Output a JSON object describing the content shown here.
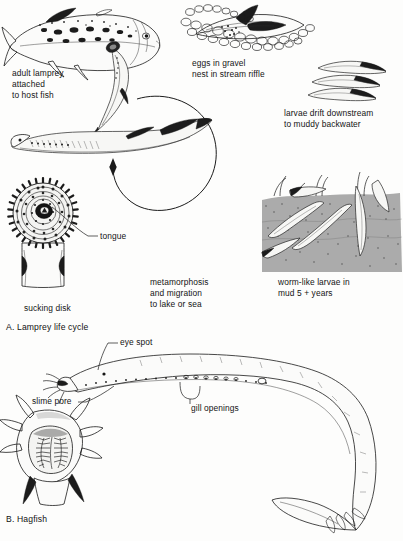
{
  "figure": {
    "panels": [
      {
        "id": "A",
        "caption": "A. Lamprey life cycle"
      },
      {
        "id": "B",
        "caption": "B. Hagfish"
      }
    ]
  },
  "panel_a": {
    "caption": "A. Lamprey life cycle",
    "stages": [
      {
        "name": "adult-parasitic-stage",
        "label": "adult lamprey\nattached\nto host fish",
        "lines": [
          "adult lamprey",
          "attached",
          "to host fish"
        ]
      },
      {
        "name": "spawning-stage",
        "label": "eggs in gravel\nnest in stream riffle",
        "lines": [
          "eggs in gravel",
          "nest in stream riffle"
        ]
      },
      {
        "name": "larval-drift-stage",
        "label": "larvae drift downstream\nto muddy backwater",
        "lines": [
          "larvae drift downstream",
          "to muddy backwater"
        ]
      },
      {
        "name": "ammocoete-burrow-stage",
        "label": "worm-like larvae in\nmud 5 + years",
        "lines": [
          "worm-like larvae in",
          "mud 5 +  years"
        ]
      },
      {
        "name": "metamorphosis-stage",
        "label": "metamorphosis\nand migration\nto lake or sea",
        "lines": [
          "metamorphosis",
          "and migration",
          "to lake or sea"
        ]
      }
    ],
    "anatomy": [
      {
        "name": "tongue",
        "label": "tongue"
      },
      {
        "name": "sucking-disk",
        "label": "sucking disk"
      }
    ],
    "cycle_arrow": {
      "name": "life-cycle-arrow",
      "direction": "clockwise"
    }
  },
  "panel_b": {
    "caption": "B. Hagfish",
    "anatomy": [
      {
        "name": "eye-spot",
        "label": "eye spot"
      },
      {
        "name": "slime-pore",
        "label": "slime pore"
      },
      {
        "name": "gill-openings",
        "label": "gill openings"
      }
    ]
  },
  "colors": {
    "ink": "#1b1b1b",
    "paper": "#fdfdfc",
    "mud": "#4a4a4a",
    "text": "#141414"
  }
}
